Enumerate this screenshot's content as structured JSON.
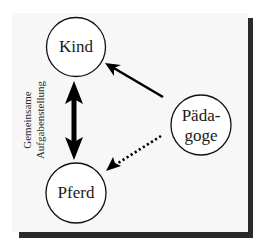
{
  "diagram": {
    "colors": {
      "panel_background": "#f7f7f7",
      "shadow": "#2a2a2a",
      "stroke": "#111111",
      "text": "#1a1a1a"
    },
    "nodes": [
      {
        "id": "kind",
        "label_lines": [
          "Kind"
        ]
      },
      {
        "id": "paedagoge",
        "label_lines": [
          "Päda-",
          "goge"
        ]
      },
      {
        "id": "pferd",
        "label_lines": [
          "Pferd"
        ]
      }
    ],
    "edges": [
      {
        "from": "kind",
        "to": "pferd",
        "style": "thick-bidirectional",
        "label": "Gemeinsame Aufgabenstellung"
      },
      {
        "from": "paedagoge",
        "to": "kind",
        "style": "solid-arrow"
      },
      {
        "from": "paedagoge",
        "to": "pferd",
        "style": "dotted-arrow"
      }
    ],
    "edge_label": {
      "lines": [
        "Gemeinsame",
        "Aufgabenstellung"
      ]
    }
  }
}
